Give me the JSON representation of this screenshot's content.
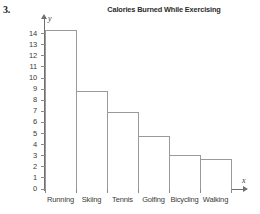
{
  "problem": {
    "number": "3."
  },
  "axis": {
    "y_axis_symbol": "y",
    "x_axis_symbol": "x",
    "y_tick_labels": [
      "0",
      "1",
      "2",
      "3",
      "4",
      "5",
      "6",
      "7",
      "8",
      "9",
      "10",
      "11",
      "12",
      "13",
      "14"
    ]
  },
  "chart_data": {
    "type": "bar",
    "title": "Calories Burned While Exercising",
    "xlabel": "",
    "ylabel": "Calories burned per minute",
    "categories": [
      "Running",
      "Skiing",
      "Tennis",
      "Golfing",
      "Bicycling",
      "Walking"
    ],
    "values": [
      14.5,
      9,
      7.1,
      5,
      3.2,
      2.85
    ],
    "ylim": [
      0,
      14
    ],
    "ytick_step": 1,
    "grid": false,
    "legend": null,
    "bar_fill": "#ffffff",
    "bar_outline": "#9a9a9a",
    "axis_color": "#6f6f6f"
  }
}
